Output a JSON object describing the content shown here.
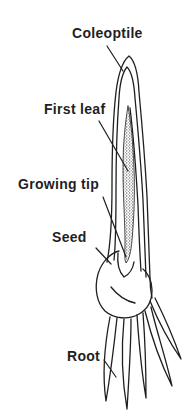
{
  "diagram": {
    "labels": {
      "coleoptile": "Coleoptile",
      "first_leaf": "First leaf",
      "growing_tip": "Growing tip",
      "seed": "Seed",
      "root": "Root"
    },
    "colors": {
      "ink": "#1f1f1f",
      "background": "#ffffff"
    }
  }
}
